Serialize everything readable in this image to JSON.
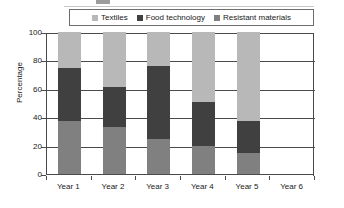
{
  "chart_data": {
    "type": "bar",
    "subtype": "stacked-bar-100",
    "title": "",
    "xlabel": "",
    "ylabel": "Percentage",
    "categories": [
      "Year 1",
      "Year 2",
      "Year 3",
      "Year 4",
      "Year 5",
      "Year 6"
    ],
    "series": [
      {
        "name": "Resistant materials",
        "color": "#808080",
        "values": [
          37,
          33,
          25,
          20,
          15,
          0
        ]
      },
      {
        "name": "Food technology",
        "color": "#404040",
        "values": [
          38,
          28,
          51,
          31,
          22,
          0
        ]
      },
      {
        "name": "Textiles",
        "color": "#b8b8b8",
        "values": [
          25,
          39,
          24,
          49,
          63,
          0
        ]
      }
    ],
    "stack_order": [
      "Resistant materials",
      "Food technology",
      "Textiles"
    ],
    "cumulative_tops": {
      "Year 1": {
        "resistant_materials": 37,
        "food_technology": 75,
        "textiles": 100
      },
      "Year 2": {
        "resistant_materials": 33,
        "food_technology": 61,
        "textiles": 100
      },
      "Year 3": {
        "resistant_materials": 25,
        "food_technology": 76,
        "textiles": 100
      },
      "Year 4": {
        "resistant_materials": 20,
        "food_technology": 51,
        "textiles": 100
      },
      "Year 5": {
        "resistant_materials": 15,
        "food_technology": 37,
        "textiles": 100
      },
      "Year 6": {
        "resistant_materials": 0,
        "food_technology": 0,
        "textiles": 0
      }
    },
    "ylim": [
      0,
      100
    ],
    "yticks": [
      0,
      20,
      40,
      60,
      80,
      100
    ],
    "ytick_labels": [
      "0",
      "20",
      "40",
      "60",
      "80",
      "100"
    ],
    "grid": true,
    "grid_axis": "y",
    "legend_position": "top",
    "legend": [
      {
        "label": "Textiles",
        "color": "#b8b8b8"
      },
      {
        "label": "Food technology",
        "color": "#404040"
      },
      {
        "label": "Resistant materials",
        "color": "#808080"
      }
    ]
  },
  "axis": {
    "y_title": "Percentage",
    "y_tick_labels": [
      "100",
      "80",
      "60",
      "40",
      "20",
      "0"
    ],
    "x_tick_labels": [
      "Year 1",
      "Year 2",
      "Year 3",
      "Year 4",
      "Year 5",
      "Year 6"
    ]
  },
  "colors": {
    "textiles": "#b8b8b8",
    "food_technology": "#404040",
    "resistant_materials": "#808080",
    "axis": "#4a4a4a",
    "text": "#1a1a1a",
    "background": "#ffffff"
  }
}
